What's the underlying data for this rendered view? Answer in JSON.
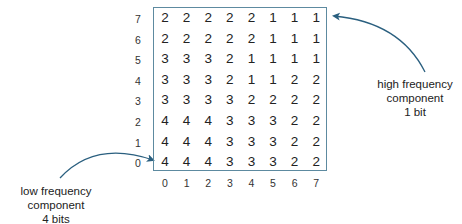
{
  "diagram": {
    "type": "bit-allocation-matrix",
    "row_labels": [
      "7",
      "6",
      "5",
      "4",
      "3",
      "2",
      "1",
      "0"
    ],
    "col_labels": [
      "0",
      "1",
      "2",
      "3",
      "4",
      "5",
      "6",
      "7"
    ],
    "matrix": [
      [
        "2",
        "2",
        "2",
        "2",
        "2",
        "1",
        "1",
        "1"
      ],
      [
        "2",
        "2",
        "2",
        "2",
        "2",
        "1",
        "1",
        "1"
      ],
      [
        "3",
        "3",
        "3",
        "2",
        "1",
        "1",
        "1",
        "1"
      ],
      [
        "3",
        "3",
        "3",
        "2",
        "1",
        "1",
        "2",
        "2"
      ],
      [
        "3",
        "3",
        "3",
        "3",
        "2",
        "2",
        "2",
        "2"
      ],
      [
        "4",
        "4",
        "4",
        "3",
        "3",
        "3",
        "2",
        "2"
      ],
      [
        "4",
        "4",
        "4",
        "3",
        "3",
        "3",
        "2",
        "2"
      ],
      [
        "4",
        "4",
        "4",
        "3",
        "3",
        "3",
        "2",
        "2"
      ]
    ],
    "annotations": {
      "high": {
        "lines": [
          "high frequency",
          "component",
          "1 bit"
        ],
        "points_to": "row 7, column 7"
      },
      "low": {
        "lines": [
          "low frequency",
          "component",
          "4 bits"
        ],
        "points_to": "row 0, column 0"
      }
    },
    "colors": {
      "arrow": "#2a5f7f",
      "grid_border": "#5d8aa0",
      "text": "#222222"
    }
  }
}
